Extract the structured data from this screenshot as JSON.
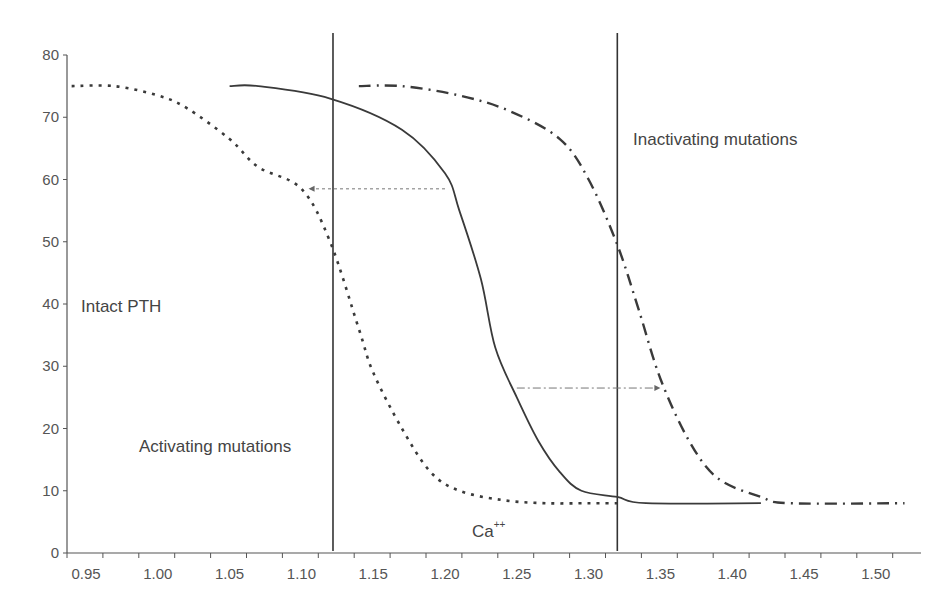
{
  "chart_data": {
    "type": "line",
    "title": "",
    "xlabel": "Ca++",
    "ylabel": "Intact PTH",
    "xlim": [
      0.93,
      1.535
    ],
    "ylim": [
      0,
      80
    ],
    "grid": false,
    "x_ticks": [
      "0.95",
      "1.00",
      "1.05",
      "1.10",
      "1.15",
      "1.20",
      "1.25",
      "1.30",
      "1.35",
      "1.40",
      "1.45",
      "1.50"
    ],
    "y_ticks": [
      "0",
      "10",
      "20",
      "30",
      "40",
      "50",
      "60",
      "70",
      "80"
    ],
    "series": [
      {
        "name": "Activating mutations",
        "style": "dotted",
        "x": [
          0.94,
          0.97,
          1.0,
          1.02,
          1.05,
          1.07,
          1.1,
          1.12,
          1.14,
          1.15,
          1.17,
          1.19,
          1.21,
          1.24,
          1.27,
          1.3,
          1.32
        ],
        "y": [
          75,
          75,
          73.5,
          71.5,
          66.5,
          62,
          58.5,
          50,
          36,
          29,
          20,
          13,
          10,
          8.5,
          8,
          8,
          8
        ]
      },
      {
        "name": "Normal",
        "style": "solid",
        "x": [
          1.05,
          1.07,
          1.12,
          1.17,
          1.2,
          1.21,
          1.225,
          1.235,
          1.25,
          1.265,
          1.28,
          1.295,
          1.32,
          1.34,
          1.42
        ],
        "y": [
          75,
          75,
          73,
          68,
          61,
          55,
          44,
          33,
          25,
          18,
          13,
          10,
          9,
          8,
          8
        ]
      },
      {
        "name": "Inactivating mutations",
        "style": "dash-dot",
        "x": [
          1.14,
          1.17,
          1.21,
          1.245,
          1.28,
          1.3,
          1.32,
          1.335,
          1.35,
          1.37,
          1.39,
          1.42,
          1.44,
          1.52
        ],
        "y": [
          75,
          75,
          73.5,
          71,
          66.5,
          60,
          49.5,
          39,
          28,
          18,
          12,
          9,
          8,
          8
        ]
      }
    ],
    "reference_lines": [
      {
        "orientation": "vertical",
        "x": 1.122,
        "style": "solid"
      },
      {
        "orientation": "vertical",
        "x": 1.32,
        "style": "solid"
      }
    ],
    "arrows": [
      {
        "style": "dashed",
        "y": 58.5,
        "from_x": 1.2,
        "to_x": 1.105,
        "direction": "left"
      },
      {
        "style": "dash-dot",
        "y": 26.5,
        "from_x": 1.25,
        "to_x": 1.35,
        "direction": "right"
      }
    ],
    "annotations": [
      {
        "text": "Inactivating mutations",
        "x": 1.33,
        "y": 68
      },
      {
        "text": "Intact PTH",
        "x": 0.96,
        "y": 40
      },
      {
        "text": "Activating mutations",
        "x": 1.0,
        "y": 16.5
      },
      {
        "text": "Ca",
        "superscript": "++",
        "x": 1.22,
        "y": 4
      }
    ]
  },
  "labels": {
    "inactivating": "Inactivating mutations",
    "intact_pth": "Intact PTH",
    "activating": "Activating mutations",
    "ca": "Ca",
    "ca_sup": "++"
  }
}
